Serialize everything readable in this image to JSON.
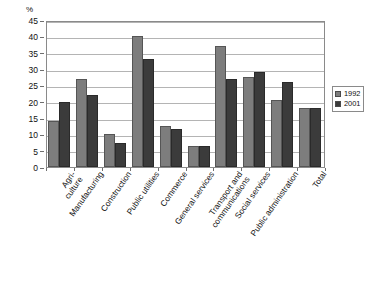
{
  "chart_data": {
    "type": "bar",
    "title": "",
    "xlabel": "",
    "ylabel": "%",
    "ylim": [
      0,
      45
    ],
    "yticks": [
      0,
      5,
      10,
      15,
      20,
      25,
      30,
      35,
      40,
      45
    ],
    "grid": true,
    "legend_position": "right",
    "categories": [
      "Agri-\nculture",
      "Manufacturing",
      "Construction",
      "Public utilities",
      "Commerce",
      "General services",
      "Transport and\ncommunications",
      "Social services",
      "Public administration",
      "Total"
    ],
    "category_lines": [
      [
        "Agri-",
        "culture"
      ],
      [
        "Manufacturing",
        ""
      ],
      [
        "Construction",
        ""
      ],
      [
        "Public utilities",
        ""
      ],
      [
        "Commerce",
        ""
      ],
      [
        "General services",
        ""
      ],
      [
        "Transport and",
        "communications"
      ],
      [
        "Social services",
        ""
      ],
      [
        "Public administration",
        ""
      ],
      [
        "Total",
        ""
      ]
    ],
    "series": [
      {
        "name": "1992",
        "color": "#7d7d7d",
        "values": [
          14.0,
          27.0,
          10.0,
          40.0,
          12.5,
          6.5,
          37.0,
          27.5,
          20.5,
          18.0
        ]
      },
      {
        "name": "2001",
        "color": "#3b3b3b",
        "values": [
          20.0,
          22.0,
          7.5,
          33.0,
          11.5,
          6.5,
          27.0,
          29.0,
          26.0,
          18.0
        ]
      }
    ]
  },
  "legend": {
    "entries": [
      {
        "label": "1992"
      },
      {
        "label": "2001"
      }
    ]
  },
  "axis": {
    "unit_label": "%"
  }
}
